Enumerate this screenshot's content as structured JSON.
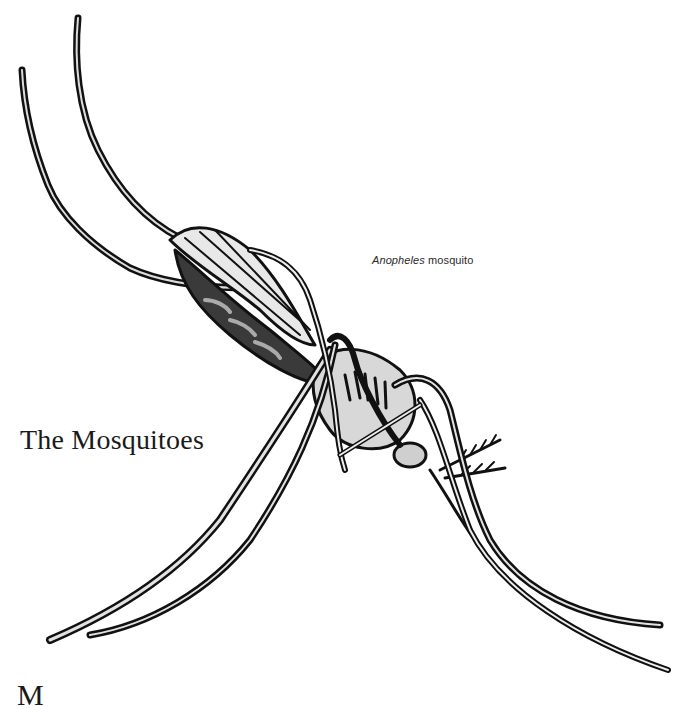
{
  "page": {
    "illustration": {
      "subject": "Anopheles mosquito line drawing",
      "ink_color": "#111111",
      "shade_color": "#bdbdbd",
      "paper_color": "#ffffff"
    },
    "caption": {
      "genus": "Anopheles",
      "rest": " mosquito"
    },
    "heading": "The Mosquitoes",
    "body_start_letter": "M"
  }
}
